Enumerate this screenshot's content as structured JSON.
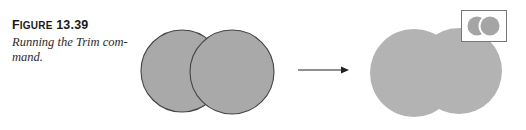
{
  "figure": {
    "label_first": "F",
    "label_rest": "IGURE",
    "number": "13.39",
    "caption_line1": "Running the Trim com-",
    "caption_line2": "mand."
  },
  "diagram": {
    "before": {
      "description": "two overlapping circles with outlines"
    },
    "arrow": {
      "direction": "right"
    },
    "after": {
      "description": "trimmed merged shape without outlines"
    },
    "inset": {
      "description": "toolbar icon showing trimmed circles"
    },
    "colors": {
      "fill_before": "#a9a9a9",
      "stroke": "#444444",
      "fill_after": "#b3b3b3",
      "inset_border": "#777777"
    }
  }
}
